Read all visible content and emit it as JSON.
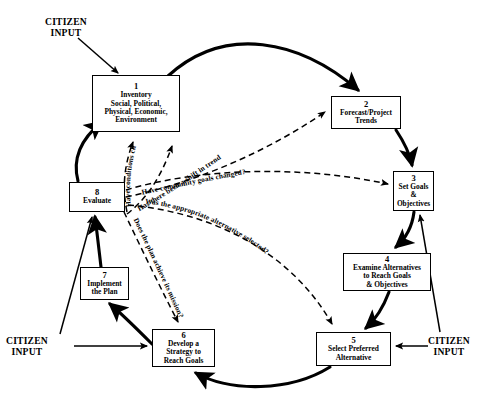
{
  "diagram": {
    "type": "cyclic-flow-diagram",
    "colors": {
      "stroke": "#000000",
      "background": "#ffffff",
      "box_border": "#000000"
    },
    "nodes": [
      {
        "id": 1,
        "number": "1",
        "label": "Inventory\nSocial, Political,\nPhysical, Economic,\nEnvironment",
        "x": 92,
        "y": 75,
        "w": 88,
        "h": 57
      },
      {
        "id": 2,
        "number": "2",
        "label": "Forecast/Project\nTrends",
        "x": 331,
        "y": 96,
        "w": 70,
        "h": 33
      },
      {
        "id": 3,
        "number": "3",
        "label": "Set Goals\n&\nObjectives",
        "x": 393,
        "y": 171,
        "w": 41,
        "h": 40
      },
      {
        "id": 4,
        "number": "4",
        "label": "Examine Alternatives\nto Reach Goals\n& Objectives",
        "x": 343,
        "y": 253,
        "w": 88,
        "h": 38
      },
      {
        "id": 5,
        "number": "5",
        "label": "Select Preferred\nAlternative",
        "x": 316,
        "y": 332,
        "w": 75,
        "h": 34
      },
      {
        "id": 6,
        "number": "6",
        "label": "Develop a\nStrategy to\nReach Goals",
        "x": 152,
        "y": 329,
        "w": 63,
        "h": 38
      },
      {
        "id": 7,
        "number": "7",
        "label": "Implement\nthe Plan",
        "x": 80,
        "y": 267,
        "w": 49,
        "h": 33
      },
      {
        "id": 8,
        "number": "8",
        "label": "Evaluate",
        "x": 69,
        "y": 182,
        "w": 56,
        "h": 30
      }
    ],
    "citizen_inputs": [
      {
        "id": "top-left",
        "label": "CITIZEN\nINPUT",
        "x": 45,
        "y": 18
      },
      {
        "id": "bottom-left",
        "label": "CITIZEN\nINPUT",
        "x": 8,
        "y": 337
      },
      {
        "id": "bottom-right",
        "label": "CITIZEN\nINPUT",
        "x": 430,
        "y": 337
      }
    ],
    "feedback_questions": [
      {
        "id": "q1",
        "text": "Have conditions changed?",
        "target_node": 1
      },
      {
        "id": "q2",
        "text": "Has there been a shift in trends?",
        "target_node": 2
      },
      {
        "id": "q3",
        "text": "Have community goals changed?",
        "target_node": 3
      },
      {
        "id": "q4",
        "text": "Was the appropriate alternative selected?",
        "target_node": 5
      },
      {
        "id": "q5",
        "text": "Does the plan achieve its mission?",
        "target_node": 6
      }
    ],
    "flow_edges": [
      {
        "from": 1,
        "to": 2,
        "style": "solid-curved"
      },
      {
        "from": 2,
        "to": 3,
        "style": "solid-curved"
      },
      {
        "from": 3,
        "to": 4,
        "style": "solid-curved"
      },
      {
        "from": 4,
        "to": 5,
        "style": "solid-curved"
      },
      {
        "from": 5,
        "to": 6,
        "style": "solid-curved"
      },
      {
        "from": 6,
        "to": 7,
        "style": "solid-curved"
      },
      {
        "from": 7,
        "to": 8,
        "style": "solid-curved"
      },
      {
        "from": 8,
        "to": 1,
        "style": "solid-curved"
      }
    ]
  }
}
